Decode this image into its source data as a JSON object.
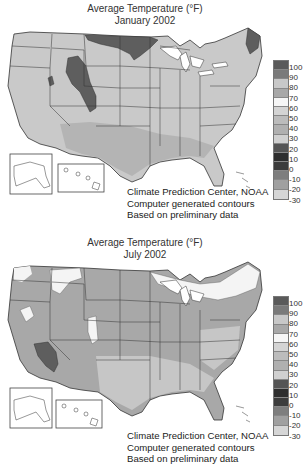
{
  "maps": [
    {
      "id": "january",
      "title_line1": "Average Temperature (°F)",
      "title_line2": "January 2002",
      "credits": [
        "Climate Prediction Center, NOAA",
        "Computer generated contours",
        "Based on preliminary data"
      ]
    },
    {
      "id": "july",
      "title_line1": "Average Temperature (°F)",
      "title_line2": "July 2002",
      "credits": [
        "Climate Prediction Center, NOAA",
        "Computer generated contours",
        "Based on preliminary data"
      ]
    }
  ],
  "legend": {
    "labels": [
      "100",
      "90",
      "80",
      "70",
      "60",
      "50",
      "40",
      "30",
      "20",
      "10",
      "0",
      "-10",
      "-20",
      "-30"
    ],
    "swatch_colors": [
      "#5a5a5a",
      "#7a7a7a",
      "#c8c8c8",
      "#a8a8a8",
      "#f6f6f6",
      "#d4d4d4",
      "#bcbcbc",
      "#b0b0b0",
      "#d0d0d0",
      "#555555",
      "#2e2e2e",
      "#3c3c3c",
      "#7e7e7e",
      "#a0a0a0",
      "#d6d6d6"
    ]
  },
  "colors": {
    "land_light": "#c9c9c9",
    "land_mid": "#a8a8a8",
    "land_dark": "#5e5e5e",
    "land_white": "#f4f4f4",
    "boundary": "#333333"
  }
}
